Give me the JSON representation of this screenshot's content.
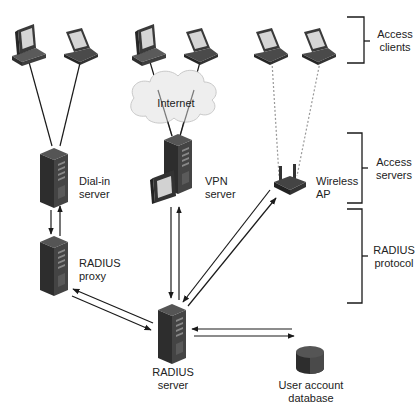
{
  "diagram": {
    "nodes": {
      "desktop_1": {
        "type": "desktop",
        "group": "Access clients"
      },
      "laptop_1": {
        "type": "laptop",
        "group": "Access clients"
      },
      "desktop_2": {
        "type": "desktop",
        "group": "Access clients"
      },
      "laptop_2": {
        "type": "laptop",
        "group": "Access clients"
      },
      "laptop_3": {
        "type": "laptop",
        "group": "Access clients"
      },
      "laptop_4": {
        "type": "laptop",
        "group": "Access clients"
      },
      "internet": {
        "type": "cloud",
        "label": "Internet"
      },
      "dialin_server": {
        "type": "server",
        "label_line1": "Dial-in",
        "label_line2": "server"
      },
      "vpn_server": {
        "type": "server",
        "label_line1": "VPN",
        "label_line2": "server"
      },
      "wireless_ap": {
        "type": "access-point",
        "label_line1": "Wireless",
        "label_line2": "AP"
      },
      "radius_proxy": {
        "type": "server",
        "label_line1": "RADIUS",
        "label_line2": "proxy"
      },
      "radius_server": {
        "type": "server",
        "label_line1": "RADIUS",
        "label_line2": "server"
      },
      "user_db": {
        "type": "database",
        "label_line1": "User account",
        "label_line2": "database"
      }
    },
    "edges": [
      {
        "from": "desktop_1",
        "to": "dialin_server",
        "style": "solid"
      },
      {
        "from": "laptop_1",
        "to": "dialin_server",
        "style": "solid"
      },
      {
        "from": "desktop_2",
        "to": "vpn_server",
        "style": "solid",
        "via": "internet"
      },
      {
        "from": "laptop_2",
        "to": "vpn_server",
        "style": "solid",
        "via": "internet"
      },
      {
        "from": "laptop_3",
        "to": "wireless_ap",
        "style": "dashed"
      },
      {
        "from": "laptop_4",
        "to": "wireless_ap",
        "style": "dashed"
      },
      {
        "from": "dialin_server",
        "to": "radius_proxy",
        "style": "bidirectional-arrows"
      },
      {
        "from": "radius_proxy",
        "to": "radius_server",
        "style": "bidirectional-arrows"
      },
      {
        "from": "vpn_server",
        "to": "radius_server",
        "style": "bidirectional-arrows"
      },
      {
        "from": "wireless_ap",
        "to": "radius_server",
        "style": "bidirectional-arrows"
      },
      {
        "from": "radius_server",
        "to": "user_db",
        "style": "bidirectional-arrows"
      }
    ],
    "brackets": [
      {
        "label_line1": "Access",
        "label_line2": "clients"
      },
      {
        "label_line1": "Access",
        "label_line2": "servers"
      },
      {
        "label_line1": "RADIUS",
        "label_line2": "protocol"
      }
    ],
    "colors": {
      "device_dark": "#3a3a3a",
      "device_mid": "#555555",
      "screen": "#d8d8d8",
      "line": "#1a1a1a",
      "dashed_line": "#999999",
      "cloud": "#eeeeee"
    }
  }
}
